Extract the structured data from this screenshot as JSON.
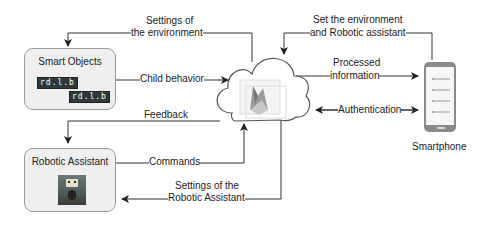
{
  "diagram": {
    "nodes": {
      "smart_objects": {
        "title": "Smart Objects",
        "chips": [
          "rd.l.b",
          "rd.l.b"
        ]
      },
      "robotic_assistant": {
        "title": "Robotic Assistant",
        "image": "robot-photo"
      },
      "cloud": {
        "icon": "cloud-icon",
        "inner_icon": "firebase-icon"
      },
      "smartphone": {
        "label": "Smartphone",
        "icon": "smartphone-icon"
      }
    },
    "edges": {
      "settings_env": {
        "line1": "Settings of",
        "line2": "the environment"
      },
      "child_behavior": {
        "label": "Child behavior"
      },
      "feedback": {
        "label": "Feedback"
      },
      "commands": {
        "label": "Commands"
      },
      "settings_robot": {
        "line1": "Settings of the",
        "line2": "Robotic Assistant"
      },
      "set_env_robot": {
        "line1": "Set the environment",
        "line2": "and Robotic assistant"
      },
      "processed_info": {
        "line1": "Processed",
        "line2": "information"
      },
      "authentication": {
        "label": "Authentication"
      }
    },
    "colors": {
      "line": "#333333",
      "box_fill": "#efefef",
      "box_border": "#9a9a9a"
    }
  }
}
